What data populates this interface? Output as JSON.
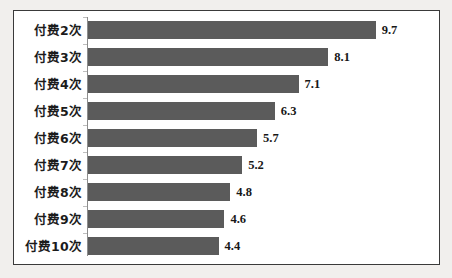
{
  "chart_data": {
    "type": "bar",
    "orientation": "horizontal",
    "title": "",
    "xlabel": "",
    "ylabel": "",
    "categories": [
      "付费2次",
      "付费3次",
      "付费4次",
      "付费5次",
      "付费6次",
      "付费7次",
      "付费8次",
      "付费9次",
      "付费10次"
    ],
    "values": [
      9.7,
      8.1,
      7.1,
      6.3,
      5.7,
      5.2,
      4.8,
      4.6,
      4.4
    ],
    "value_labels": [
      "9.7",
      "8.1",
      "7.1",
      "6.3",
      "5.7",
      "5.2",
      "4.8",
      "4.6",
      "4.4"
    ],
    "xlim": [
      0,
      11.8
    ],
    "grid": false,
    "legend": null,
    "data_labels": true,
    "colors": {
      "bar": "#5b5b5b",
      "axis": "#8d8d8d",
      "border": "#3a3a3a",
      "plot_background": "#ffffff",
      "page_background": "#f1efed",
      "text": "#1b1b1b"
    }
  }
}
